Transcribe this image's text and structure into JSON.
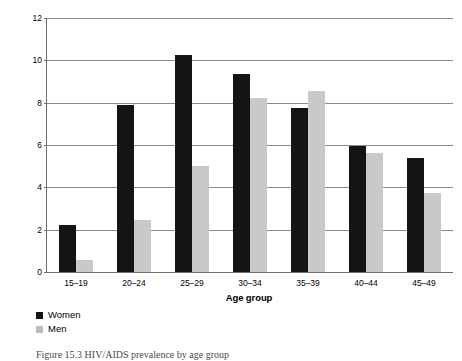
{
  "figure": {
    "caption": "Figure 15.3 HIV/AIDS prevalence by age group"
  },
  "legend": {
    "position": "bottom-left",
    "items": [
      {
        "label": "Women",
        "color": "#141414",
        "swatch": "legend-swatch-women"
      },
      {
        "label": "Men",
        "color": "#bdbdbd",
        "swatch": "legend-swatch-men"
      }
    ]
  },
  "axes": {
    "y": {
      "title": "HIV/AIDS prevalence (per cent)",
      "ticks": [
        "0",
        "2",
        "4",
        "6",
        "8",
        "10",
        "12"
      ],
      "min": 0,
      "max": 12
    },
    "x": {
      "title": "Age group",
      "ticks": [
        "15–19",
        "20–24",
        "25–29",
        "30–34",
        "35–39",
        "40–44",
        "45–49"
      ]
    }
  },
  "chart_data": {
    "type": "bar",
    "title": "",
    "subtitle": "",
    "xlabel": "Age group",
    "ylabel": "HIV/AIDS prevalence (per cent)",
    "categories": [
      "15–19",
      "20–24",
      "25–29",
      "30–34",
      "35–39",
      "40–44",
      "45–49"
    ],
    "series": [
      {
        "name": "Women",
        "color": "#141414",
        "values": [
          2.2,
          7.9,
          10.25,
          9.35,
          7.75,
          5.95,
          5.4
        ]
      },
      {
        "name": "Men",
        "color": "#c9c9c9",
        "values": [
          0.55,
          2.45,
          5.0,
          8.2,
          8.55,
          5.6,
          3.75
        ]
      }
    ],
    "ylim": [
      0,
      12
    ],
    "ytick_step": 2,
    "grid": true,
    "grid_axis": "y",
    "legend_position": "bottom-left",
    "bar_orientation": "vertical",
    "annotations": []
  }
}
